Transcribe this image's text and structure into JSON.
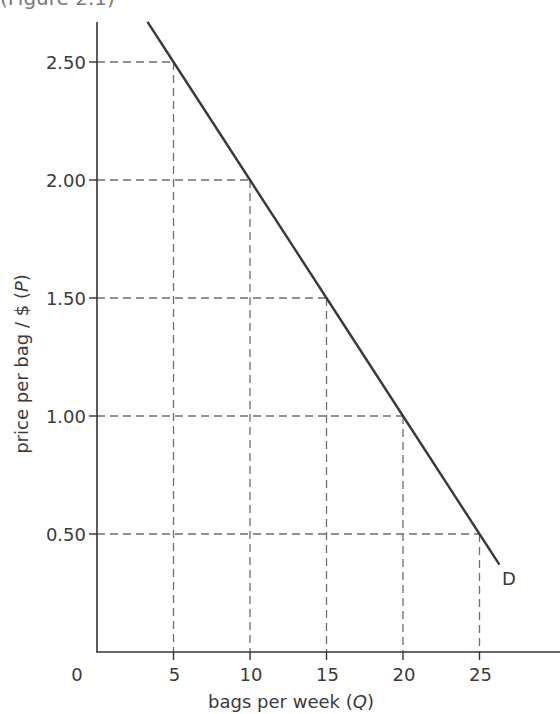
{
  "caption": {
    "text": "(Figure 2.1)",
    "note": "partially cropped at top edge"
  },
  "axes": {
    "origin_label": "0",
    "x_label_prefix": "bags per week (",
    "x_label_var": "Q",
    "x_label_suffix": ")",
    "y_label_prefix": "price per bag / $ (",
    "y_label_var": "P",
    "y_label_suffix": ")"
  },
  "curve_label": "D",
  "colors": {
    "axis": "#333333",
    "curve": "#3a3a3a",
    "grid_dashed": "#6e6e6e",
    "text": "#3a3a3a"
  },
  "chart_data": {
    "type": "line",
    "title": "",
    "xlabel": "bags per week (Q)",
    "ylabel": "price per bag / $ (P)",
    "xlim": [
      0,
      30
    ],
    "ylim": [
      0,
      2.75
    ],
    "x_ticks": [
      5,
      10,
      15,
      20,
      25
    ],
    "x_tick_labels": [
      "5",
      "10",
      "15",
      "20",
      "25"
    ],
    "y_ticks": [
      0.5,
      1.0,
      1.5,
      2.0,
      2.5
    ],
    "y_tick_labels": [
      "0.50",
      "1.00",
      "1.50",
      "2.00",
      "2.50"
    ],
    "grid": false,
    "legend": null,
    "series": [
      {
        "name": "D",
        "style": "solid line",
        "equation": "P = 3.00 - 0.10Q",
        "x": [
          3.3,
          5,
          10,
          15,
          20,
          25,
          26.3
        ],
        "y": [
          2.67,
          2.5,
          2.0,
          1.5,
          1.0,
          0.5,
          0.37
        ]
      }
    ],
    "reference_points": [
      {
        "Q": 5,
        "P": 2.5
      },
      {
        "Q": 10,
        "P": 2.0
      },
      {
        "Q": 15,
        "P": 1.5
      },
      {
        "Q": 20,
        "P": 1.0
      },
      {
        "Q": 25,
        "P": 0.5
      }
    ],
    "annotations": [
      {
        "text": "D",
        "at": {
          "Q": 26.8,
          "P": 0.31
        }
      },
      {
        "text": "0",
        "position": "origin"
      },
      {
        "text": "dashed drop lines from each point to both axes"
      }
    ]
  }
}
